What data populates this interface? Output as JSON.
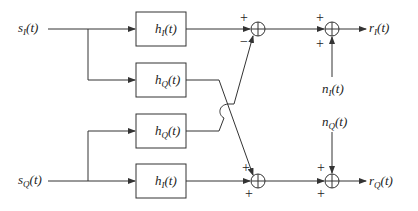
{
  "diagram": {
    "type": "block-diagram",
    "title": "",
    "colors": {
      "stroke": "#333333",
      "background": "#ffffff",
      "text": "#222222"
    },
    "inputs": [
      {
        "id": "sI",
        "base": "s",
        "sub": "I",
        "arg": "(t)"
      },
      {
        "id": "sQ",
        "base": "s",
        "sub": "Q",
        "arg": "(t)"
      }
    ],
    "blocks": [
      {
        "id": "hI_top",
        "base": "h",
        "sub": "I",
        "arg": "(t)"
      },
      {
        "id": "hQ_upper",
        "base": "h",
        "sub": "Q",
        "arg": "(t)"
      },
      {
        "id": "hQ_lower",
        "base": "h",
        "sub": "Q",
        "arg": "(t)"
      },
      {
        "id": "hI_bottom",
        "base": "h",
        "sub": "I",
        "arg": "(t)"
      }
    ],
    "summers": [
      {
        "id": "sum1_top",
        "signs": {
          "top": "+",
          "bottom": "−"
        }
      },
      {
        "id": "sum2_top",
        "signs": {
          "top": "+",
          "bottom": "+"
        }
      },
      {
        "id": "sum1_bottom",
        "signs": {
          "top": "+",
          "bottom": "+"
        }
      },
      {
        "id": "sum2_bottom",
        "signs": {
          "top": "+",
          "bottom": "+"
        }
      }
    ],
    "noise": [
      {
        "id": "nI",
        "base": "n",
        "sub": "I",
        "arg": "(t)"
      },
      {
        "id": "nQ",
        "base": "n",
        "sub": "Q",
        "arg": "(t)"
      }
    ],
    "outputs": [
      {
        "id": "rI",
        "base": "r",
        "sub": "I",
        "arg": "(t)"
      },
      {
        "id": "rQ",
        "base": "r",
        "sub": "Q",
        "arg": "(t)"
      }
    ],
    "connections": [
      "sI -> hI_top",
      "sI -> hQ_upper",
      "sQ -> hQ_lower",
      "sQ -> hI_bottom",
      "hI_top -> sum1_top (+)",
      "hQ_lower -> sum1_top (−)",
      "hQ_upper -> sum1_bottom (+)",
      "hI_bottom -> sum1_bottom (+)",
      "sum1_top -> sum2_top (+)",
      "nI -> sum2_top (+)",
      "sum1_bottom -> sum2_bottom (+)",
      "nQ -> sum2_bottom (+)",
      "sum2_top -> rI",
      "sum2_bottom -> rQ"
    ]
  }
}
